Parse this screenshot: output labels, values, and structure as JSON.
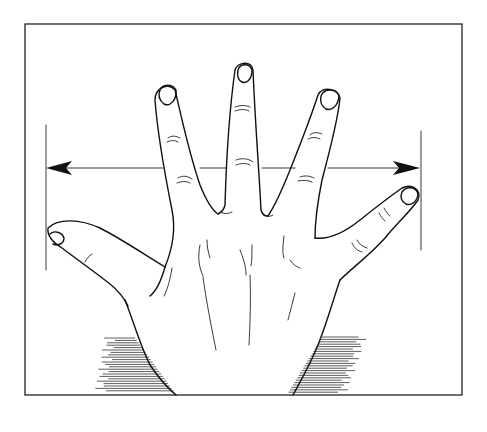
{
  "figure": {
    "colors": {
      "ink": "#111111",
      "background": "#ffffff"
    },
    "parts": {
      "frame": "border-frame",
      "hand": "open-hand",
      "measurement": "span-arrow",
      "shading": "wrist-shadow-hatching"
    }
  }
}
